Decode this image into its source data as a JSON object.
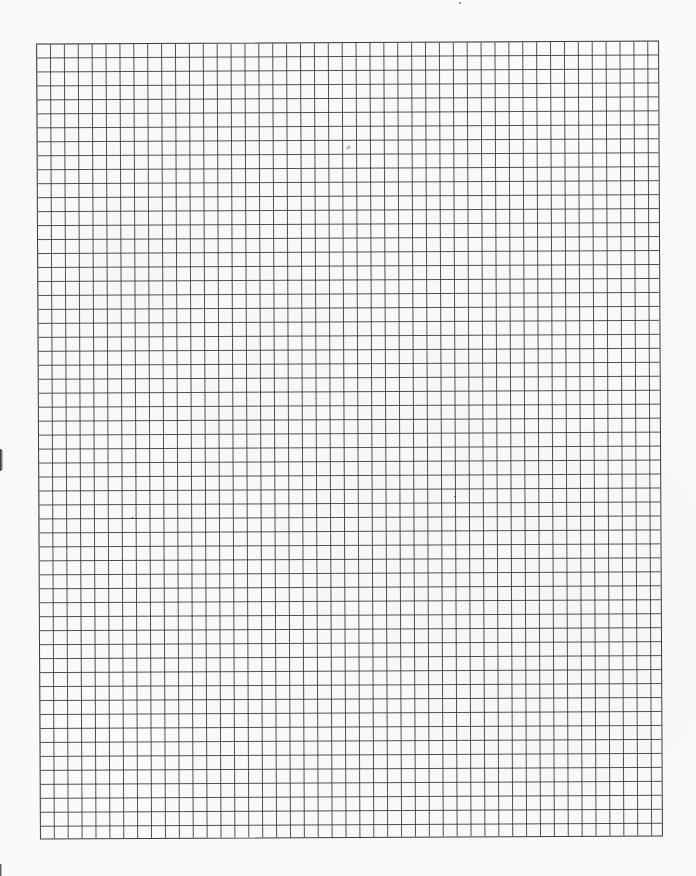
{
  "document": {
    "type": "graph-paper",
    "grid": {
      "columns": 45,
      "rows": 57,
      "cell_size_px": 14,
      "line_color": "#3c3c3c",
      "background_color": "#fafaf9"
    },
    "marks": [
      {
        "kind": "smudge",
        "description": "faint pencil smudge"
      },
      {
        "kind": "speck",
        "description": "scan speck in top margin"
      },
      {
        "kind": "hole-punch-edge",
        "description": "left margin punch edge"
      },
      {
        "kind": "hole-punch-edge",
        "description": "lower-left margin edge"
      }
    ]
  }
}
